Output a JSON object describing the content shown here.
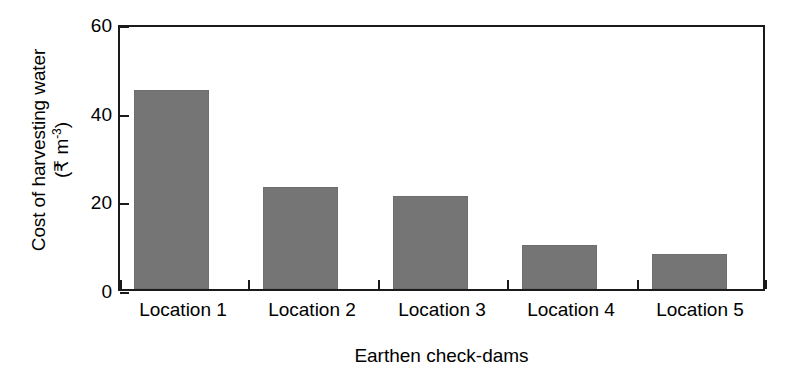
{
  "chart_data": {
    "type": "bar",
    "title": "",
    "subtitle": "",
    "categories": [
      "Location 1",
      "Location 2",
      "Location 3",
      "Location 4",
      "Location 5"
    ],
    "values": [
      45,
      23,
      21,
      10,
      8
    ],
    "xlabel": "Earthen check-dams",
    "ylabel_line1": "Cost of harvesting water",
    "ylabel_line2_prefix": "(₹ m",
    "ylabel_line2_sup": "-3",
    "ylabel_line2_suffix": ")",
    "ylabel_plain": "Cost of harvesting water (₹ m-3)",
    "ylim": [
      0,
      60
    ],
    "yticks": [
      0,
      20,
      40,
      60
    ],
    "ytick_labels": [
      "0",
      "20",
      "40",
      "60"
    ],
    "grid": false,
    "legend": "none",
    "bar_color": "#757575",
    "axis_color": "#1a1a1a",
    "background": "#ffffff"
  }
}
